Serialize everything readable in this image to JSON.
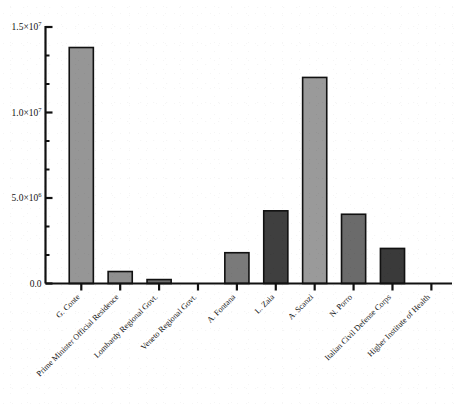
{
  "chart_data": {
    "type": "bar",
    "title": "",
    "subtitle": "",
    "xlabel": "",
    "ylabel": "",
    "grid": false,
    "legend": "none",
    "ylim": [
      0,
      15000000
    ],
    "ytick_values": [
      0,
      5000000,
      10000000,
      15000000
    ],
    "ytick_labels": [
      "0.0",
      "5.0×10⁶",
      "1.0×10⁷",
      "1.5×10⁷"
    ],
    "ytick_mantissas": [
      "0.0",
      "5.0×10",
      "1.0×10",
      "1.5×10"
    ],
    "ytick_exponents": [
      "",
      "6",
      "7",
      "7"
    ],
    "minor_ticks_per_interval": 2,
    "categories": [
      "G. Conte",
      "Prime Minister Official Residence",
      "Lombardy Regional Govt.",
      "Veneto Regional Govt.",
      "A. Fontana",
      "L. Zaia",
      "A. Scanzi",
      "N. Porro",
      "Italian Civil Defense Corps",
      "Higher Institute of Health"
    ],
    "values": [
      13800000,
      700000,
      230000,
      0,
      1800000,
      4250000,
      12050000,
      4050000,
      2050000,
      0
    ],
    "bar_colors": [
      "#969696",
      "#8f8f8f",
      "#6e6e6e",
      "#969696",
      "#7a7a7a",
      "#3f3f3f",
      "#9a9a9a",
      "#6b6b6b",
      "#3a3a3a",
      "#969696"
    ],
    "bar_edge_color": "#111111",
    "axis_color": "#111111",
    "background_color": "#ffffff",
    "xtick_label_rotation_deg": -45
  }
}
